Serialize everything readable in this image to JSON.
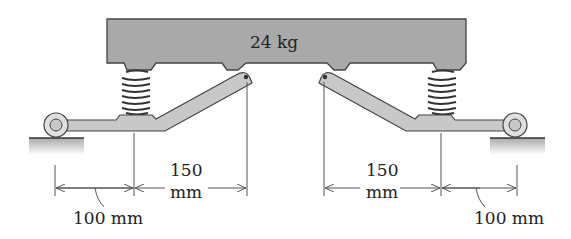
{
  "diagram": {
    "mass_label": "24 kg",
    "colors": {
      "block_fill": "#a9a9a9",
      "link_fill": "#c8c8c8",
      "outline": "#444444",
      "ground_fill": "#bdbdbd",
      "dimension_line": "#555555",
      "text": "#222222"
    },
    "dimensions": [
      {
        "id": "left-outer",
        "value": "100",
        "unit": "mm",
        "text": "100 mm"
      },
      {
        "id": "left-inner",
        "value": "150",
        "unit": "mm"
      },
      {
        "id": "right-inner",
        "value": "150",
        "unit": "mm"
      },
      {
        "id": "right-outer",
        "value": "100",
        "unit": "mm",
        "text": "100 mm"
      }
    ],
    "components": {
      "block": "24 kg block",
      "springs": 2,
      "links": 2,
      "rollers": 2,
      "grounds": 2
    }
  }
}
